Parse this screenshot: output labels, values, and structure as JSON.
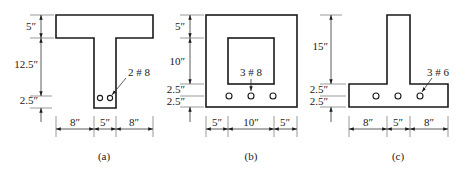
{
  "figures": [
    {
      "id": "a",
      "caption": "(a)",
      "type": "T-beam",
      "vertical_dims": [
        "5″",
        "12.5″",
        "2.5″"
      ],
      "horizontal_dims": [
        "8″",
        "5″",
        "8″"
      ],
      "rebar_label": "2 # 8",
      "bar_count": 2
    },
    {
      "id": "b",
      "caption": "(b)",
      "type": "hollow box beam",
      "vertical_dims": [
        "5″",
        "10″",
        "2.5″",
        "2.5″"
      ],
      "horizontal_dims": [
        "5″",
        "10″",
        "5″"
      ],
      "rebar_label": "3 # 8",
      "bar_count": 3
    },
    {
      "id": "c",
      "caption": "(c)",
      "type": "inverted T-beam",
      "vertical_dims": [
        "15″",
        "2.5″",
        "2.5″"
      ],
      "horizontal_dims": [
        "8″",
        "5″",
        "8″"
      ],
      "rebar_label": "3 # 6",
      "bar_count": 3
    }
  ]
}
